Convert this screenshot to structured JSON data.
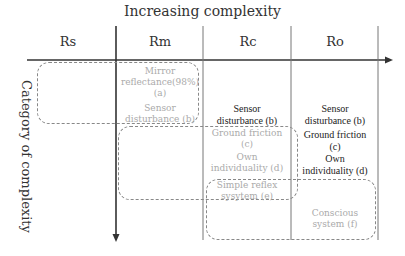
{
  "title": "Increasing complexity",
  "y_axis_label": "Category of complexity",
  "columns": [
    {
      "label": "Rs"
    },
    {
      "label": "Rm"
    },
    {
      "label": "Rc"
    },
    {
      "label": "Ro"
    }
  ],
  "rm": {
    "mirror": "Mirror",
    "reflectance": "reflectance(98%)",
    "a": "(a)",
    "sensor": "Sensor",
    "disturbance": "disturbance (b)"
  },
  "rc": {
    "sensor": "Sensor",
    "disturbance": "disturbance (b)",
    "ground": "Ground friction",
    "c": "(c)",
    "own": "Own",
    "individuality": "individuality (d)",
    "simple": "Simple reflex",
    "system": "sysytem (e)"
  },
  "ro": {
    "sensor": "Sensor",
    "disturbance": "disturbance (b)",
    "ground": "Ground friction",
    "c": "(c)",
    "own": "Own",
    "individuality": "individuality (d)",
    "conscious": "Conscious",
    "system": "system (f)"
  },
  "colors": {
    "axis": "#333333",
    "divider": "#777777",
    "box_border": "#888888",
    "faded_text": "#aaaaaa",
    "dark_text": "#222222"
  }
}
